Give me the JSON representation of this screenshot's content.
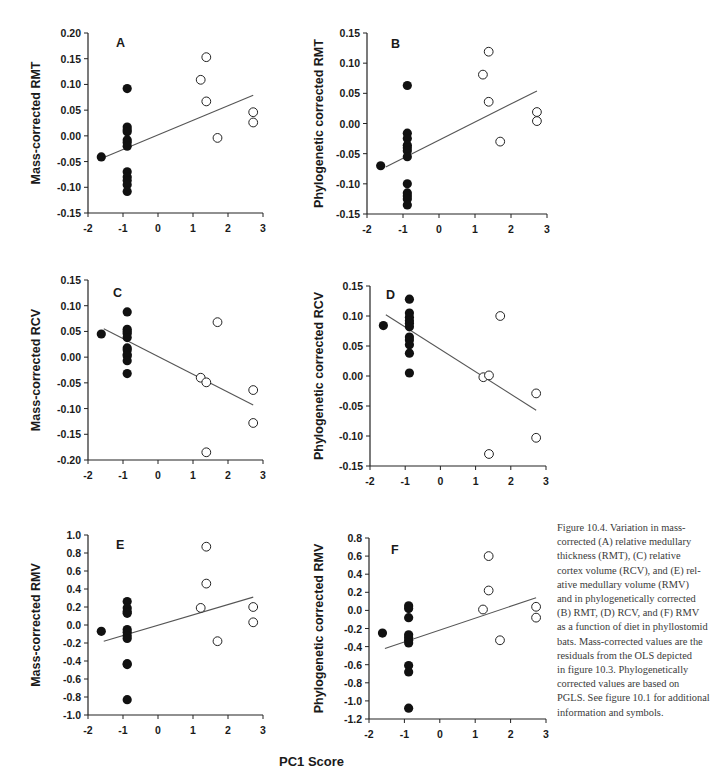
{
  "figure": {
    "shared_xlabel": "PC1 Score",
    "caption_lines": [
      "Figure 10.4.  Variation in mass-",
      "corrected (A) relative medullary",
      "thickness (RMT), (C) relative",
      "cortex volume (RCV), and (E) rel-",
      "ative medullary volume (RMV)",
      "and in phylogenetically corrected",
      "(B) RMT, (D) RCV, and (F) RMV",
      "as a function of diet in phyllostomid",
      "bats. Mass-corrected values are the",
      "residuals from the OLS depicted",
      "in figure 10.3. Phylogenetically",
      "corrected values are based on",
      "PGLS. See figure 10.1 for additional",
      "information and symbols."
    ],
    "colors": {
      "filled_marker": "#111111",
      "open_marker_stroke": "#222222",
      "axis": "#222222",
      "regression_line": "#555555"
    }
  },
  "chart_data": [
    {
      "type": "scatter",
      "panel": "A",
      "title": "A",
      "xlabel": "PC1 Score",
      "ylabel": "Mass-corrected RMT",
      "xlim": [
        -2,
        3
      ],
      "ylim": [
        -0.15,
        0.2
      ],
      "xticks": [
        -2,
        -1,
        0,
        1,
        2,
        3
      ],
      "yticks": [
        0.2,
        0.15,
        0.1,
        0.05,
        0.0,
        -0.05,
        -0.1,
        -0.15
      ],
      "ytick_labels": [
        "0.20",
        "0.15",
        "0.10",
        "0.05",
        "0.00",
        "-0.05",
        "-0.10",
        "-0.15"
      ],
      "grid": false,
      "series": [
        {
          "name": "filled",
          "style": "filled",
          "points": [
            [
              -1.62,
              -0.041
            ],
            [
              -0.88,
              0.092
            ],
            [
              -0.88,
              0.017
            ],
            [
              -0.88,
              0.012
            ],
            [
              -0.88,
              0.008
            ],
            [
              -0.88,
              -0.008
            ],
            [
              -0.88,
              -0.013
            ],
            [
              -0.88,
              -0.02
            ],
            [
              -0.88,
              -0.07
            ],
            [
              -0.88,
              -0.08
            ],
            [
              -0.88,
              -0.087
            ],
            [
              -0.88,
              -0.095
            ],
            [
              -0.88,
              -0.108
            ]
          ]
        },
        {
          "name": "open",
          "style": "open",
          "points": [
            [
              1.22,
              0.109
            ],
            [
              1.38,
              0.153
            ],
            [
              1.38,
              0.067
            ],
            [
              1.7,
              -0.004
            ],
            [
              2.72,
              0.046
            ],
            [
              2.72,
              0.026
            ]
          ]
        }
      ],
      "regression": {
        "x1": -1.55,
        "y1": -0.042,
        "x2": 2.72,
        "y2": 0.079
      }
    },
    {
      "type": "scatter",
      "panel": "B",
      "title": "B",
      "xlabel": "PC1 Score",
      "ylabel": "Phylogenetic corrected RMT",
      "xlim": [
        -2,
        3
      ],
      "ylim": [
        -0.15,
        0.15
      ],
      "xticks": [
        -2,
        -1,
        0,
        1,
        2,
        3
      ],
      "yticks": [
        0.15,
        0.1,
        0.05,
        0.0,
        -0.05,
        -0.1,
        -0.15
      ],
      "ytick_labels": [
        "0.15",
        "0.10",
        "0.05",
        "0.00",
        "-0.05",
        "-0.10",
        "-0.15"
      ],
      "grid": false,
      "series": [
        {
          "name": "filled",
          "style": "filled",
          "points": [
            [
              -1.62,
              -0.07
            ],
            [
              -0.88,
              0.063
            ],
            [
              -0.88,
              -0.016
            ],
            [
              -0.88,
              -0.025
            ],
            [
              -0.88,
              -0.036
            ],
            [
              -0.88,
              -0.04
            ],
            [
              -0.88,
              -0.045
            ],
            [
              -0.88,
              -0.055
            ],
            [
              -0.88,
              -0.1
            ],
            [
              -0.88,
              -0.115
            ],
            [
              -0.88,
              -0.12
            ],
            [
              -0.88,
              -0.125
            ],
            [
              -0.88,
              -0.135
            ]
          ]
        },
        {
          "name": "open",
          "style": "open",
          "points": [
            [
              1.22,
              0.081
            ],
            [
              1.38,
              0.119
            ],
            [
              1.38,
              0.036
            ],
            [
              1.7,
              -0.03
            ],
            [
              2.72,
              0.019
            ],
            [
              2.72,
              0.004
            ]
          ]
        }
      ],
      "regression": {
        "x1": -1.48,
        "y1": -0.072,
        "x2": 2.72,
        "y2": 0.054
      }
    },
    {
      "type": "scatter",
      "panel": "C",
      "title": "C",
      "xlabel": "PC1 Score",
      "ylabel": "Mass-corrected RCV",
      "xlim": [
        -2,
        3
      ],
      "ylim": [
        -0.2,
        0.15
      ],
      "xticks": [
        -2,
        -1,
        0,
        1,
        2,
        3
      ],
      "yticks": [
        0.15,
        0.1,
        0.05,
        0.0,
        -0.05,
        -0.1,
        -0.15,
        -0.2
      ],
      "ytick_labels": [
        "0.15",
        "0.10",
        "0.05",
        "0.00",
        "-0.05",
        "-0.10",
        "-0.15",
        "-0.20"
      ],
      "grid": false,
      "series": [
        {
          "name": "filled",
          "style": "filled",
          "points": [
            [
              -1.62,
              0.045
            ],
            [
              -0.88,
              0.088
            ],
            [
              -0.88,
              0.054
            ],
            [
              -0.88,
              0.05
            ],
            [
              -0.88,
              0.046
            ],
            [
              -0.88,
              0.038
            ],
            [
              -0.88,
              0.018
            ],
            [
              -0.88,
              0.014
            ],
            [
              -0.88,
              0.005
            ],
            [
              -0.88,
              0.002
            ],
            [
              -0.88,
              -0.007
            ],
            [
              -0.88,
              -0.032
            ]
          ]
        },
        {
          "name": "open",
          "style": "open",
          "points": [
            [
              1.22,
              -0.04
            ],
            [
              1.38,
              -0.049
            ],
            [
              1.38,
              -0.185
            ],
            [
              1.7,
              0.068
            ],
            [
              2.72,
              -0.064
            ],
            [
              2.72,
              -0.128
            ]
          ]
        }
      ],
      "regression": {
        "x1": -1.55,
        "y1": 0.055,
        "x2": 2.72,
        "y2": -0.093
      }
    },
    {
      "type": "scatter",
      "panel": "D",
      "title": "D",
      "xlabel": "PC1 Score",
      "ylabel": "Phylogenetic corrected RCV",
      "xlim": [
        -2,
        3
      ],
      "ylim": [
        -0.15,
        0.15
      ],
      "xticks": [
        -2,
        -1,
        0,
        1,
        2,
        3
      ],
      "yticks": [
        0.15,
        0.1,
        0.05,
        0.0,
        -0.05,
        -0.1,
        -0.15
      ],
      "ytick_labels": [
        "0.15",
        "0.10",
        "0.05",
        "0.00",
        "-0.05",
        "-0.10",
        "-0.15"
      ],
      "grid": false,
      "series": [
        {
          "name": "filled",
          "style": "filled",
          "points": [
            [
              -1.62,
              0.084
            ],
            [
              -0.88,
              0.128
            ],
            [
              -0.88,
              0.105
            ],
            [
              -0.88,
              0.098
            ],
            [
              -0.88,
              0.092
            ],
            [
              -0.88,
              0.088
            ],
            [
              -0.88,
              0.082
            ],
            [
              -0.88,
              0.065
            ],
            [
              -0.88,
              0.06
            ],
            [
              -0.88,
              0.052
            ],
            [
              -0.88,
              0.038
            ],
            [
              -0.88,
              0.005
            ]
          ]
        },
        {
          "name": "open",
          "style": "open",
          "points": [
            [
              1.22,
              -0.002
            ],
            [
              1.38,
              0.001
            ],
            [
              1.38,
              -0.13
            ],
            [
              1.7,
              0.1
            ],
            [
              2.72,
              -0.029
            ],
            [
              2.72,
              -0.103
            ]
          ]
        }
      ],
      "regression": {
        "x1": -1.55,
        "y1": 0.102,
        "x2": 2.72,
        "y2": -0.057
      }
    },
    {
      "type": "scatter",
      "panel": "E",
      "title": "E",
      "xlabel": "PC1 Score",
      "ylabel": "Mass-corrected RMV",
      "xlim": [
        -2,
        3
      ],
      "ylim": [
        -1.0,
        1.0
      ],
      "xticks": [
        -2,
        -1,
        0,
        1,
        2,
        3
      ],
      "yticks": [
        1.0,
        0.8,
        0.6,
        0.4,
        0.2,
        0.0,
        -0.2,
        -0.4,
        -0.6,
        -0.8,
        -1.0
      ],
      "ytick_labels": [
        "1.0",
        "0.8",
        "0.6",
        "0.4",
        "0.2",
        "0.0",
        "-0.2",
        "-0.4",
        "-0.6",
        "-0.8",
        "-1.0"
      ],
      "grid": false,
      "series": [
        {
          "name": "filled",
          "style": "filled",
          "points": [
            [
              -1.62,
              -0.07
            ],
            [
              -0.88,
              0.26
            ],
            [
              -0.88,
              0.19
            ],
            [
              -0.88,
              0.15
            ],
            [
              -0.88,
              0.13
            ],
            [
              -0.88,
              -0.05
            ],
            [
              -0.88,
              -0.08
            ],
            [
              -0.88,
              -0.12
            ],
            [
              -0.88,
              -0.15
            ],
            [
              -0.88,
              -0.43
            ],
            [
              -0.88,
              -0.44
            ],
            [
              -0.88,
              -0.83
            ]
          ]
        },
        {
          "name": "open",
          "style": "open",
          "points": [
            [
              1.22,
              0.19
            ],
            [
              1.38,
              0.87
            ],
            [
              1.38,
              0.46
            ],
            [
              1.7,
              -0.18
            ],
            [
              2.72,
              0.2
            ],
            [
              2.72,
              0.03
            ]
          ]
        }
      ],
      "regression": {
        "x1": -1.55,
        "y1": -0.18,
        "x2": 2.72,
        "y2": 0.31
      }
    },
    {
      "type": "scatter",
      "panel": "F",
      "title": "F",
      "xlabel": "PC1 Score",
      "ylabel": "Phylogenetic corrected RMV",
      "xlim": [
        -2,
        3
      ],
      "ylim": [
        -1.2,
        0.8
      ],
      "xticks": [
        -2,
        -1,
        0,
        1,
        2,
        3
      ],
      "yticks": [
        0.8,
        0.6,
        0.4,
        0.2,
        0.0,
        -0.2,
        -0.4,
        -0.6,
        -0.8,
        -1.0,
        -1.2
      ],
      "ytick_labels": [
        "0.8",
        "0.6",
        "0.4",
        "0.2",
        "0.0",
        "-0.2",
        "-0.4",
        "-0.6",
        "-0.8",
        "-1.0",
        "-1.2"
      ],
      "grid": false,
      "series": [
        {
          "name": "filled",
          "style": "filled",
          "points": [
            [
              -1.62,
              -0.25
            ],
            [
              -0.88,
              0.05
            ],
            [
              -0.88,
              0.02
            ],
            [
              -0.88,
              -0.08
            ],
            [
              -0.88,
              -0.27
            ],
            [
              -0.88,
              -0.3
            ],
            [
              -0.88,
              -0.33
            ],
            [
              -0.88,
              -0.36
            ],
            [
              -0.88,
              -0.61
            ],
            [
              -0.88,
              -0.68
            ],
            [
              -0.88,
              -1.08
            ]
          ]
        },
        {
          "name": "open",
          "style": "open",
          "points": [
            [
              1.22,
              0.01
            ],
            [
              1.38,
              0.6
            ],
            [
              1.38,
              0.22
            ],
            [
              1.7,
              -0.33
            ],
            [
              2.72,
              0.04
            ],
            [
              2.72,
              -0.08
            ]
          ]
        }
      ],
      "regression": {
        "x1": -1.55,
        "y1": -0.42,
        "x2": 2.72,
        "y2": 0.14
      }
    }
  ],
  "layout": {
    "panels": [
      {
        "x0": 88,
        "x1": 263,
        "y0": 33,
        "y1": 213,
        "ylabel_x": 40,
        "title_dx": 28,
        "title_dy": 14
      },
      {
        "x0": 367,
        "x1": 547,
        "y0": 33,
        "y1": 214,
        "ylabel_x": 323,
        "title_dx": 24,
        "title_dy": 15
      },
      {
        "x0": 88,
        "x1": 263,
        "y0": 280,
        "y1": 460,
        "ylabel_x": 40,
        "title_dx": 25,
        "title_dy": 17
      },
      {
        "x0": 370,
        "x1": 546,
        "y0": 286,
        "y1": 466,
        "ylabel_x": 323,
        "title_dx": 16,
        "title_dy": 13
      },
      {
        "x0": 88,
        "x1": 263,
        "y0": 535,
        "y1": 715,
        "ylabel_x": 40,
        "title_dx": 28,
        "title_dy": 14
      },
      {
        "x0": 369,
        "x1": 546,
        "y0": 538,
        "y1": 719,
        "ylabel_x": 323,
        "title_dx": 22,
        "title_dy": 16
      }
    ]
  }
}
